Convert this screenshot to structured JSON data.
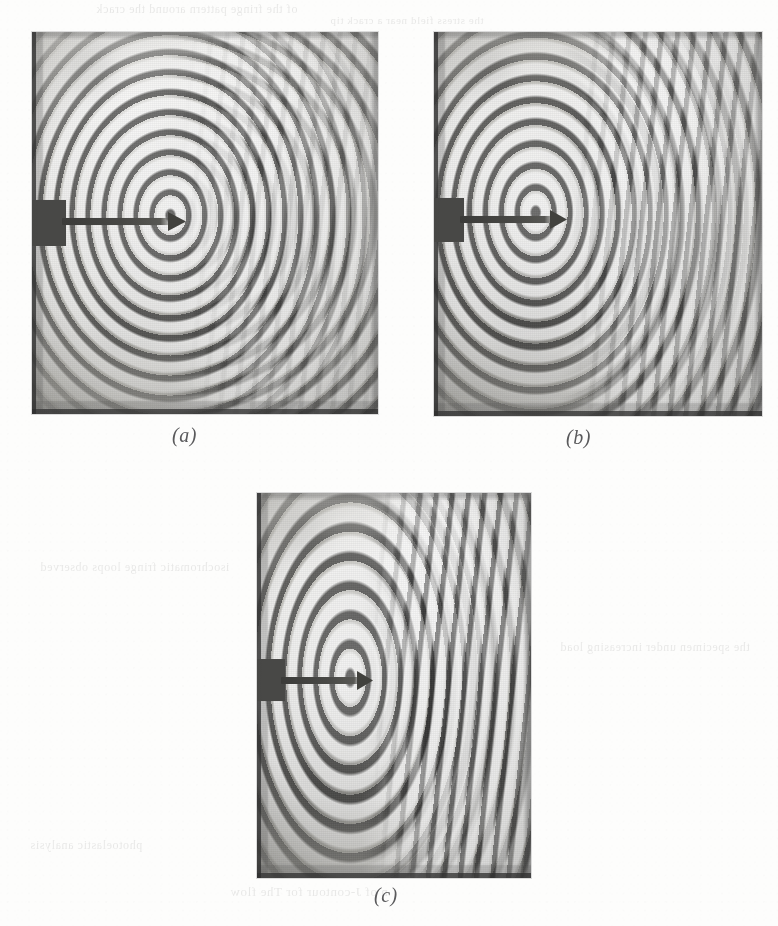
{
  "document": {
    "type": "scanned-book-page",
    "background_color": "#fdfdfc",
    "width": 778,
    "height": 926
  },
  "figure": {
    "name": "photoelastic-fringe-figure",
    "panels": [
      {
        "id": "a",
        "caption": "(a)",
        "alt": "Photoelastic fringe pattern (a): small concentric isochromatic loops at the crack tip, light background field",
        "frame": {
          "left": 32,
          "top": 32,
          "width": 346,
          "height": 382
        },
        "crack_tip": {
          "x_pct": 40,
          "y_pct": 48
        },
        "fringe": {
          "ellipse_w": "15%",
          "ellipse_h": "17%",
          "lobe_w": "34%",
          "lobe_h": "30%"
        },
        "band_opacity": 0.18,
        "field_tone": "light",
        "load_stage": "low load"
      },
      {
        "id": "b",
        "caption": "(b)",
        "alt": "Photoelastic fringe pattern (b): enlarged forward-tilted fringe lobes extending to the right of the crack tip",
        "frame": {
          "left": 434,
          "top": 32,
          "width": 328,
          "height": 384
        },
        "crack_tip": {
          "x_pct": 31,
          "y_pct": 47
        },
        "fringe": {
          "ellipse_w": "12%",
          "ellipse_h": "14%",
          "lobe_w": "40%",
          "lobe_h": "46%"
        },
        "band_opacity": 0.55,
        "field_tone": "mid",
        "load_stage": "intermediate load"
      },
      {
        "id": "c",
        "caption": "(c)",
        "alt": "Photoelastic fringe pattern (c): fully developed fringe field with dense vertical fringe band right of the crack tip",
        "frame": {
          "left": 257,
          "top": 493,
          "width": 274,
          "height": 385
        },
        "crack_tip": {
          "x_pct": 34,
          "y_pct": 48
        },
        "fringe": {
          "ellipse_w": "10%",
          "ellipse_h": "13%",
          "lobe_w": "46%",
          "lobe_h": "58%"
        },
        "band_opacity": 0.95,
        "field_tone": "mid-dark",
        "load_stage": "high load"
      }
    ]
  },
  "bleedthrough": {
    "note": "faint mirrored text showing through from the reverse side of the page",
    "lines": [
      "of the fringe pattern around the crack",
      "the stress field near a crack tip",
      "isochromatic fringe loops observed",
      "the specimen under increasing load",
      "n of J-contour for The flow",
      "photoelastic analysis"
    ]
  },
  "colors": {
    "paper": "#fdfdfc",
    "caption_text": "#5a5a5c",
    "photo_midtone": "#b9b9b4",
    "notch_dark": "#4a4a48",
    "crack_dark": "#3d3d3b"
  }
}
